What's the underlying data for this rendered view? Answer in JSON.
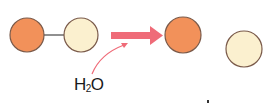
{
  "diagram": {
    "type": "hydrolysis-reaction",
    "reactant": {
      "molecule": "dimer",
      "units": [
        {
          "name": "unit-a",
          "color": "#f2915a"
        },
        {
          "name": "unit-b",
          "color": "#fbf0cf"
        }
      ],
      "bond_color": "#6b6b6b"
    },
    "reagent": {
      "label_main": "H",
      "label_sub": "2",
      "label_end": "O"
    },
    "arrow": {
      "color": "#ef6b78",
      "direction": "right"
    },
    "products": [
      {
        "name": "unit-a",
        "color": "#f2915a"
      },
      {
        "name": "unit-b",
        "color": "#fbf0cf"
      }
    ],
    "colors": {
      "orange_fill": "#f2915a",
      "cream_fill": "#fbf0cf",
      "outline": "#7a5a4a",
      "arrow": "#ef6b78"
    }
  }
}
